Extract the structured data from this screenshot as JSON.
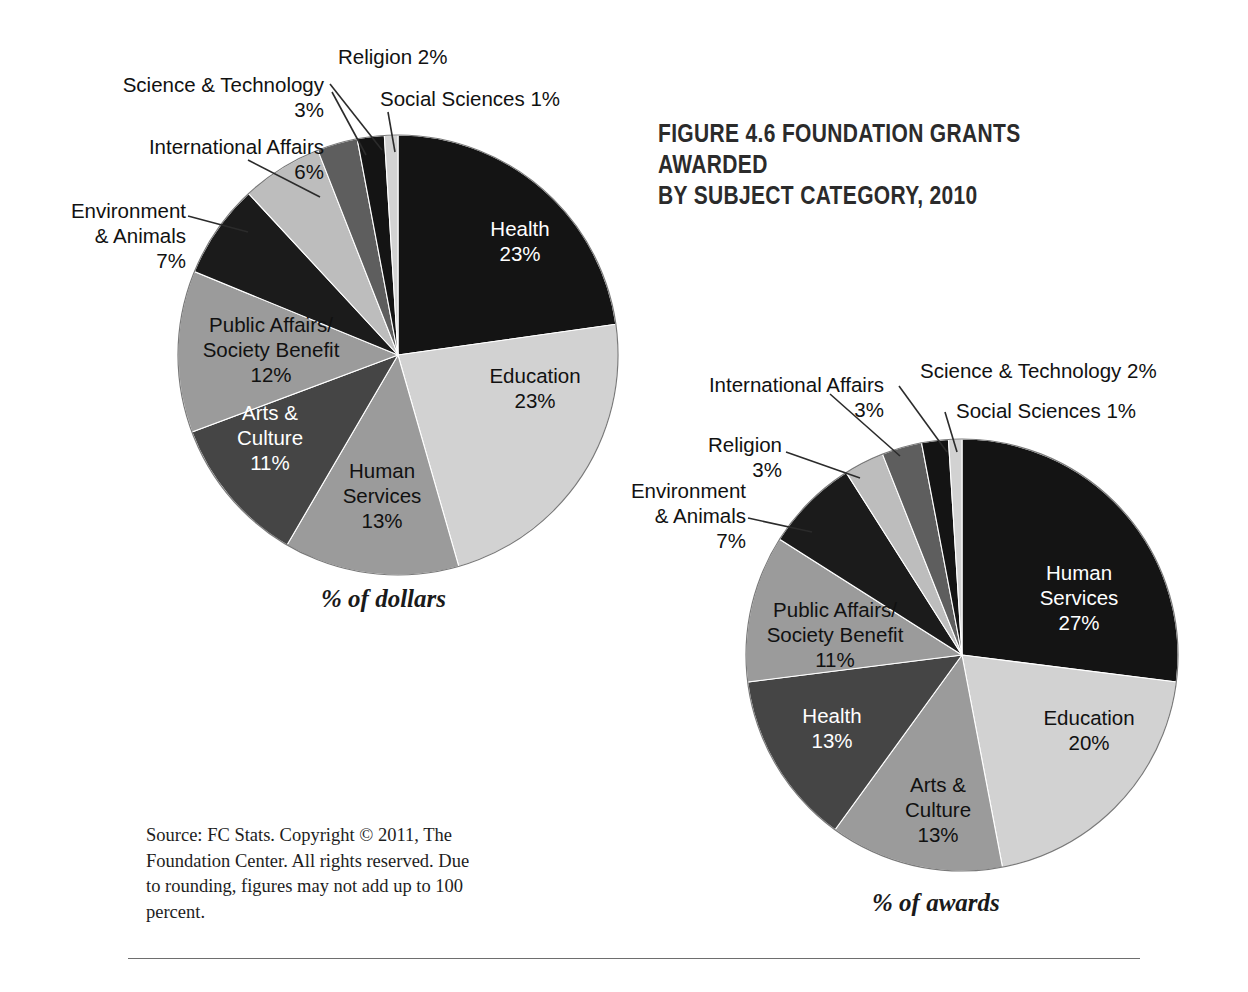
{
  "figure": {
    "title": "FIGURE 4.6 FOUNDATION GRANTS AWARDED\nBY SUBJECT CATEGORY, 2010",
    "source_note": "Source: FC Stats. Copyright © 2011, The Foundation Center. All rights reserved. Due to rounding, figures may not add up to 100 percent."
  },
  "palette": {
    "black": "#141414",
    "near_black": "#1b1b1b",
    "light_gray": "#d2d2d2",
    "mid_gray": "#9b9b9b",
    "dark_gray": "#454545",
    "mid_dark_gray": "#5e5e5e",
    "pale_gray": "#bdbdbd",
    "outline": "#7a7a7a",
    "leader_line": "#2b2b2b",
    "rule": "#6e6e6e"
  },
  "chart_data": [
    {
      "type": "pie",
      "id": "dollars",
      "title": "% of dollars",
      "caption": "% of dollars",
      "total": 100,
      "start_angle_deg": 0,
      "direction": "clockwise",
      "center": [
        398,
        355
      ],
      "radius": 220,
      "categories": [
        "Health",
        "Education",
        "Human Services",
        "Arts & Culture",
        "Public Affairs/Society Benefit",
        "Environment & Animals",
        "International Affairs",
        "Science & Technology",
        "Religion",
        "Social Sciences"
      ],
      "values": [
        23,
        23,
        13,
        11,
        12,
        7,
        6,
        3,
        2,
        1
      ],
      "slices": [
        {
          "label": "Health",
          "value": 23,
          "pct": "23%",
          "color": "#141414",
          "label_pos": "inside",
          "text_color": "light",
          "lines": [
            "Health",
            "23%"
          ]
        },
        {
          "label": "Education",
          "value": 23,
          "pct": "23%",
          "color": "#d2d2d2",
          "label_pos": "inside",
          "text_color": "dark",
          "lines": [
            "Education",
            "23%"
          ]
        },
        {
          "label": "Human Services",
          "value": 13,
          "pct": "13%",
          "color": "#9b9b9b",
          "label_pos": "inside",
          "text_color": "dark",
          "lines": [
            "Human",
            "Services",
            "13%"
          ]
        },
        {
          "label": "Arts & Culture",
          "value": 11,
          "pct": "11%",
          "color": "#454545",
          "label_pos": "inside",
          "text_color": "light",
          "lines": [
            "Arts &",
            "Culture",
            "11%"
          ]
        },
        {
          "label": "Public Affairs/Society Benefit",
          "value": 12,
          "pct": "12%",
          "color": "#9b9b9b",
          "label_pos": "inside",
          "text_color": "dark",
          "lines": [
            "Public Affairs/",
            "Society Benefit",
            "12%"
          ]
        },
        {
          "label": "Environment & Animals",
          "value": 7,
          "pct": "7%",
          "color": "#1b1b1b",
          "label_pos": "outside",
          "text_color": "dark",
          "lines": [
            "Environment",
            "& Animals",
            "7%"
          ]
        },
        {
          "label": "International Affairs",
          "value": 6,
          "pct": "6%",
          "color": "#bdbdbd",
          "label_pos": "outside",
          "text_color": "dark",
          "lines": [
            "International Affairs",
            "6%"
          ]
        },
        {
          "label": "Science & Technology",
          "value": 3,
          "pct": "3%",
          "color": "#5e5e5e",
          "label_pos": "outside",
          "text_color": "dark",
          "lines": [
            "Science & Technology",
            "3%"
          ]
        },
        {
          "label": "Religion",
          "value": 2,
          "pct": "2%",
          "color": "#141414",
          "label_pos": "outside",
          "text_color": "dark",
          "lines": [
            "Religion 2%"
          ]
        },
        {
          "label": "Social Sciences",
          "value": 1,
          "pct": "1%",
          "color": "#d2d2d2",
          "label_pos": "outside",
          "text_color": "dark",
          "lines": [
            "Social Sciences 1%"
          ]
        }
      ],
      "callouts": {
        "science_technology": "Science & Technology\n3%",
        "international_affairs": "International Affairs\n6%",
        "environment_animals": "Environment\n& Animals\n7%",
        "religion": "Religion 2%",
        "social_sciences": "Social Sciences 1%"
      },
      "inside_labels": {
        "health": "Health\n23%",
        "education": "Education\n23%",
        "human_services": "Human\nServices\n13%",
        "arts_culture": "Arts &\nCulture\n11%",
        "public_affairs": "Public Affairs/\nSociety Benefit\n12%"
      }
    },
    {
      "type": "pie",
      "id": "awards",
      "title": "% of awards",
      "caption": "% of awards",
      "total": 100,
      "start_angle_deg": 0,
      "direction": "clockwise",
      "center": [
        962,
        655
      ],
      "radius": 216,
      "categories": [
        "Human Services",
        "Education",
        "Arts & Culture",
        "Health",
        "Public Affairs/Society Benefit",
        "Environment & Animals",
        "Religion",
        "International Affairs",
        "Science & Technology",
        "Social Sciences"
      ],
      "values": [
        27,
        20,
        13,
        13,
        11,
        7,
        3,
        3,
        2,
        1
      ],
      "slices": [
        {
          "label": "Human Services",
          "value": 27,
          "pct": "27%",
          "color": "#141414",
          "label_pos": "inside",
          "text_color": "light",
          "lines": [
            "Human",
            "Services",
            "27%"
          ]
        },
        {
          "label": "Education",
          "value": 20,
          "pct": "20%",
          "color": "#d2d2d2",
          "label_pos": "inside",
          "text_color": "dark",
          "lines": [
            "Education",
            "20%"
          ]
        },
        {
          "label": "Arts & Culture",
          "value": 13,
          "pct": "13%",
          "color": "#9b9b9b",
          "label_pos": "inside",
          "text_color": "dark",
          "lines": [
            "Arts &",
            "Culture",
            "13%"
          ]
        },
        {
          "label": "Health",
          "value": 13,
          "pct": "13%",
          "color": "#454545",
          "label_pos": "inside",
          "text_color": "light",
          "lines": [
            "Health",
            "13%"
          ]
        },
        {
          "label": "Public Affairs/Society Benefit",
          "value": 11,
          "pct": "11%",
          "color": "#9b9b9b",
          "label_pos": "inside",
          "text_color": "dark",
          "lines": [
            "Public Affairs/",
            "Society Benefit",
            "11%"
          ]
        },
        {
          "label": "Environment & Animals",
          "value": 7,
          "pct": "7%",
          "color": "#1b1b1b",
          "label_pos": "outside",
          "text_color": "dark",
          "lines": [
            "Environment",
            "& Animals",
            "7%"
          ]
        },
        {
          "label": "Religion",
          "value": 3,
          "pct": "3%",
          "color": "#bdbdbd",
          "label_pos": "outside",
          "text_color": "dark",
          "lines": [
            "Religion",
            "3%"
          ]
        },
        {
          "label": "International Affairs",
          "value": 3,
          "pct": "3%",
          "color": "#5e5e5e",
          "label_pos": "outside",
          "text_color": "dark",
          "lines": [
            "International Affairs",
            "3%"
          ]
        },
        {
          "label": "Science & Technology",
          "value": 2,
          "pct": "2%",
          "color": "#141414",
          "label_pos": "outside",
          "text_color": "dark",
          "lines": [
            "Science & Technology 2%"
          ]
        },
        {
          "label": "Social Sciences",
          "value": 1,
          "pct": "1%",
          "color": "#d2d2d2",
          "label_pos": "outside",
          "text_color": "dark",
          "lines": [
            "Social Sciences 1%"
          ]
        }
      ],
      "callouts": {
        "international_affairs": "International Affairs\n3%",
        "religion": "Religion\n3%",
        "environment_animals": "Environment\n& Animals\n7%",
        "science_technology": "Science & Technology 2%",
        "social_sciences": "Social Sciences 1%"
      },
      "inside_labels": {
        "human_services": "Human\nServices\n27%",
        "education": "Education\n20%",
        "arts_culture": "Arts &\nCulture\n13%",
        "health": "Health\n13%",
        "public_affairs": "Public Affairs/\nSociety Benefit\n11%"
      }
    }
  ]
}
